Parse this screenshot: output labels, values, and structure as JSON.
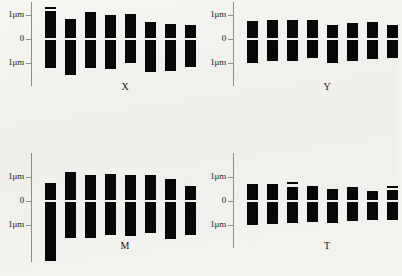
{
  "figure": {
    "unit": "μm",
    "axis": {
      "tick_top_label": "1μm",
      "tick_mid_label": "0",
      "tick_bottom_label": "1μm",
      "tick_values": [
        1,
        0,
        -1
      ]
    },
    "panels": [
      {
        "id": "panel-x",
        "label": "X",
        "chromosome_count": 8,
        "chromosomes": [
          {
            "n": 1,
            "short_arm": 1.18,
            "long_arm": 1.22,
            "satellite": true,
            "satellite_len": 0.09,
            "satellite_gap": 0.07
          },
          {
            "n": 2,
            "short_arm": 0.83,
            "long_arm": 1.49,
            "satellite": false,
            "satellite_len": 0,
            "satellite_gap": 0
          },
          {
            "n": 3,
            "short_arm": 1.11,
            "long_arm": 1.22,
            "satellite": false,
            "satellite_len": 0,
            "satellite_gap": 0
          },
          {
            "n": 4,
            "short_arm": 0.98,
            "long_arm": 1.26,
            "satellite": false,
            "satellite_len": 0,
            "satellite_gap": 0
          },
          {
            "n": 5,
            "short_arm": 1.05,
            "long_arm": 1.02,
            "satellite": false,
            "satellite_len": 0,
            "satellite_gap": 0
          },
          {
            "n": 6,
            "short_arm": 0.72,
            "long_arm": 1.38,
            "satellite": false,
            "satellite_len": 0,
            "satellite_gap": 0
          },
          {
            "n": 7,
            "short_arm": 0.62,
            "long_arm": 1.33,
            "satellite": false,
            "satellite_len": 0,
            "satellite_gap": 0
          },
          {
            "n": 8,
            "short_arm": 0.58,
            "long_arm": 1.15,
            "satellite": false,
            "satellite_len": 0,
            "satellite_gap": 0
          }
        ]
      },
      {
        "id": "panel-y",
        "label": "Y",
        "chromosome_count": 8,
        "chromosomes": [
          {
            "n": 1,
            "short_arm": 0.75,
            "long_arm": 1.0,
            "satellite": false,
            "satellite_len": 0,
            "satellite_gap": 0
          },
          {
            "n": 2,
            "short_arm": 0.8,
            "long_arm": 0.92,
            "satellite": false,
            "satellite_len": 0,
            "satellite_gap": 0
          },
          {
            "n": 3,
            "short_arm": 0.78,
            "long_arm": 0.9,
            "satellite": false,
            "satellite_len": 0,
            "satellite_gap": 0
          },
          {
            "n": 4,
            "short_arm": 0.8,
            "long_arm": 0.8,
            "satellite": false,
            "satellite_len": 0,
            "satellite_gap": 0
          },
          {
            "n": 5,
            "short_arm": 0.6,
            "long_arm": 1.0,
            "satellite": false,
            "satellite_len": 0,
            "satellite_gap": 0
          },
          {
            "n": 6,
            "short_arm": 0.66,
            "long_arm": 0.92,
            "satellite": false,
            "satellite_len": 0,
            "satellite_gap": 0
          },
          {
            "n": 7,
            "short_arm": 0.7,
            "long_arm": 0.82,
            "satellite": false,
            "satellite_len": 0,
            "satellite_gap": 0
          },
          {
            "n": 8,
            "short_arm": 0.58,
            "long_arm": 0.78,
            "satellite": false,
            "satellite_len": 0,
            "satellite_gap": 0
          }
        ]
      },
      {
        "id": "panel-m",
        "label": "M",
        "chromosome_count": 8,
        "chromosomes": [
          {
            "n": 1,
            "short_arm": 0.76,
            "long_arm": 2.52,
            "satellite": false,
            "satellite_len": 0,
            "satellite_gap": 0
          },
          {
            "n": 2,
            "short_arm": 1.22,
            "long_arm": 1.56,
            "satellite": false,
            "satellite_len": 0,
            "satellite_gap": 0
          },
          {
            "n": 3,
            "short_arm": 1.1,
            "long_arm": 1.54,
            "satellite": false,
            "satellite_len": 0,
            "satellite_gap": 0
          },
          {
            "n": 4,
            "short_arm": 1.12,
            "long_arm": 1.4,
            "satellite": false,
            "satellite_len": 0,
            "satellite_gap": 0
          },
          {
            "n": 5,
            "short_arm": 1.08,
            "long_arm": 1.46,
            "satellite": false,
            "satellite_len": 0,
            "satellite_gap": 0
          },
          {
            "n": 6,
            "short_arm": 1.08,
            "long_arm": 1.34,
            "satellite": false,
            "satellite_len": 0,
            "satellite_gap": 0
          },
          {
            "n": 7,
            "short_arm": 0.92,
            "long_arm": 1.58,
            "satellite": false,
            "satellite_len": 0,
            "satellite_gap": 0
          },
          {
            "n": 8,
            "short_arm": 0.62,
            "long_arm": 1.42,
            "satellite": false,
            "satellite_len": 0,
            "satellite_gap": 0
          }
        ]
      },
      {
        "id": "panel-t",
        "label": "T",
        "chromosome_count": 8,
        "chromosomes": [
          {
            "n": 1,
            "short_arm": 0.72,
            "long_arm": 1.02,
            "satellite": false,
            "satellite_len": 0,
            "satellite_gap": 0
          },
          {
            "n": 2,
            "short_arm": 0.7,
            "long_arm": 0.96,
            "satellite": false,
            "satellite_len": 0,
            "satellite_gap": 0
          },
          {
            "n": 3,
            "short_arm": 0.6,
            "long_arm": 0.92,
            "satellite": true,
            "satellite_len": 0.1,
            "satellite_gap": 0.09
          },
          {
            "n": 4,
            "short_arm": 0.62,
            "long_arm": 0.86,
            "satellite": false,
            "satellite_len": 0,
            "satellite_gap": 0
          },
          {
            "n": 5,
            "short_arm": 0.48,
            "long_arm": 0.92,
            "satellite": false,
            "satellite_len": 0,
            "satellite_gap": 0
          },
          {
            "n": 6,
            "short_arm": 0.58,
            "long_arm": 0.82,
            "satellite": false,
            "satellite_len": 0,
            "satellite_gap": 0
          },
          {
            "n": 7,
            "short_arm": 0.42,
            "long_arm": 0.78,
            "satellite": false,
            "satellite_len": 0,
            "satellite_gap": 0
          },
          {
            "n": 8,
            "short_arm": 0.46,
            "long_arm": 0.8,
            "satellite": true,
            "satellite_len": 0.09,
            "satellite_gap": 0.08
          }
        ]
      }
    ]
  },
  "chart_data": {
    "type": "bar",
    "xlabel": "",
    "ylabel": "μm",
    "ylim": [
      -2.6,
      1.4
    ],
    "grid": false,
    "legend": "none",
    "note": "Each bar is one chromosome; the white line at y=0 is the centromere. Values above 0 are short-arm lengths, values below 0 are long-arm lengths, in μm.",
    "panels": [
      "X",
      "Y",
      "M",
      "T"
    ],
    "categories": [
      "1",
      "2",
      "3",
      "4",
      "5",
      "6",
      "7",
      "8"
    ],
    "series": [
      {
        "name": "X short arm",
        "values": [
          1.18,
          0.83,
          1.11,
          0.98,
          1.05,
          0.72,
          0.62,
          0.58
        ]
      },
      {
        "name": "X long arm",
        "values": [
          -1.22,
          -1.49,
          -1.22,
          -1.26,
          -1.02,
          -1.38,
          -1.33,
          -1.15
        ]
      },
      {
        "name": "Y short arm",
        "values": [
          0.75,
          0.8,
          0.78,
          0.8,
          0.6,
          0.66,
          0.7,
          0.58
        ]
      },
      {
        "name": "Y long arm",
        "values": [
          -1.0,
          -0.92,
          -0.9,
          -0.8,
          -1.0,
          -0.92,
          -0.82,
          -0.78
        ]
      },
      {
        "name": "M short arm",
        "values": [
          0.76,
          1.22,
          1.1,
          1.12,
          1.08,
          1.08,
          0.92,
          0.62
        ]
      },
      {
        "name": "M long arm",
        "values": [
          -2.52,
          -1.56,
          -1.54,
          -1.4,
          -1.46,
          -1.34,
          -1.58,
          -1.42
        ]
      },
      {
        "name": "T short arm",
        "values": [
          0.72,
          0.7,
          0.6,
          0.62,
          0.48,
          0.58,
          0.42,
          0.46
        ]
      },
      {
        "name": "T long arm",
        "values": [
          -1.02,
          -0.96,
          -0.92,
          -0.86,
          -0.92,
          -0.82,
          -0.78,
          -0.8
        ]
      }
    ],
    "satellites": [
      {
        "panel": "X",
        "chromosome": 1,
        "length": 0.09
      },
      {
        "panel": "T",
        "chromosome": 3,
        "length": 0.1
      },
      {
        "panel": "T",
        "chromosome": 8,
        "length": 0.09
      }
    ]
  }
}
